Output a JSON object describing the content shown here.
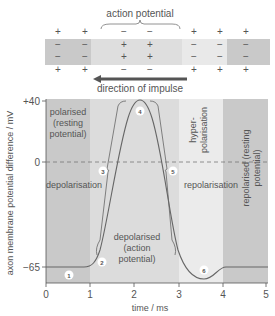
{
  "axon": {
    "brace_label": "action potential",
    "arrow_label": "direction of impulse",
    "columns": [
      {
        "x": 58,
        "outer": "+",
        "inner": "−",
        "zone": "resting"
      },
      {
        "x": 85,
        "outer": "+",
        "inner": "−",
        "zone": "resting"
      },
      {
        "x": 124,
        "outer": "−",
        "inner": "+",
        "zone": "action"
      },
      {
        "x": 150,
        "outer": "−",
        "inner": "+",
        "zone": "action"
      },
      {
        "x": 194,
        "outer": "+",
        "inner": "−",
        "zone": "recovering"
      },
      {
        "x": 220,
        "outer": "+",
        "inner": "−",
        "zone": "recovering"
      },
      {
        "x": 246,
        "outer": "+",
        "inner": "−",
        "zone": "resting"
      }
    ]
  },
  "chart_data": {
    "type": "line",
    "title": "",
    "xlabel": "time / ms",
    "ylabel": "axon membrane potential difference / mV",
    "xlim": [
      0,
      5
    ],
    "x_ticks": [
      "0",
      "1",
      "2",
      "3",
      "4",
      "5"
    ],
    "y_ticks": [
      "+40",
      "0",
      "−65"
    ],
    "reference_line": {
      "y": 0,
      "style": "dashed"
    },
    "series": [
      {
        "name": "membrane potential",
        "x": [
          0,
          0.5,
          1.0,
          1.2,
          1.5,
          1.8,
          2.0,
          2.2,
          2.5,
          2.8,
          3.0,
          3.3,
          3.6,
          3.8,
          4.0,
          4.5,
          5.0
        ],
        "y": [
          -65,
          -65,
          -64,
          -55,
          -10,
          30,
          40,
          30,
          -10,
          -50,
          -68,
          -75,
          -78,
          -75,
          -66,
          -65,
          -65
        ]
      }
    ],
    "phases": [
      {
        "label": "polarised (resting potential)",
        "x_range": [
          0,
          1
        ],
        "shade": "#c9c9c9"
      },
      {
        "label": "depolarised (action potential)",
        "x_range": [
          1,
          3
        ],
        "shade": "#dcdcdc"
      },
      {
        "label": "hyper-polarisation",
        "x_range": [
          3,
          4
        ],
        "shade": "#ebebeb"
      },
      {
        "label": "repolarised (resting potential)",
        "x_range": [
          4,
          5
        ],
        "shade": "#c9c9c9"
      }
    ],
    "annotations": [
      {
        "label": "depolarisation",
        "marker": "3"
      },
      {
        "label": "repolarisation",
        "marker": "5"
      }
    ],
    "markers": [
      "1",
      "2",
      "3",
      "4",
      "5",
      "6"
    ],
    "grid": false
  },
  "labels": {
    "polarised": [
      "polarised",
      "(resting",
      "potential)"
    ],
    "depolarisation": "depolarisation",
    "depolarised": [
      "depolarised",
      "(action",
      "potential)"
    ],
    "hyper": [
      "hyper-",
      "polarisation"
    ],
    "repolarisation": "repolarisation",
    "repolarised": [
      "repolarised (resting",
      "potential)"
    ],
    "y_axis": "axon membrane potential difference / mV",
    "x_axis": "time / ms",
    "y_pos40": "+40",
    "y_zero": "0",
    "y_neg65": "−65",
    "x0": "0",
    "x1": "1",
    "x2": "2",
    "x3": "3",
    "x4": "4",
    "x5": "5",
    "m1": "1",
    "m2": "2",
    "m3": "3",
    "m4": "4",
    "m5": "5",
    "m6": "6"
  }
}
